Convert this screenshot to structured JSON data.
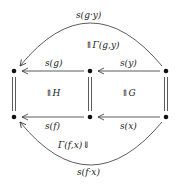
{
  "diagram": {
    "top_arc_label": "s(g·y)",
    "top_two_cell_label": "⇑Γ(g,y)",
    "top_left_arrow_label": "s(g)",
    "top_right_arrow_label": "s(y)",
    "left_square_cell_label": "⇑H",
    "right_square_cell_label": "⇑G",
    "bottom_left_arrow_label": "s(f)",
    "bottom_right_arrow_label": "s(x)",
    "bottom_two_cell_label": "Γ(f,x)⇓",
    "bottom_arc_label": "s(f·x)",
    "nodes": [
      {
        "id": "top-left",
        "x": 14,
        "y": 71
      },
      {
        "id": "top-middle",
        "x": 90,
        "y": 71
      },
      {
        "id": "top-right",
        "x": 166,
        "y": 71
      },
      {
        "id": "bottom-left",
        "x": 14,
        "y": 117
      },
      {
        "id": "bottom-middle",
        "x": 90,
        "y": 117
      },
      {
        "id": "bottom-right",
        "x": 166,
        "y": 117
      }
    ]
  }
}
